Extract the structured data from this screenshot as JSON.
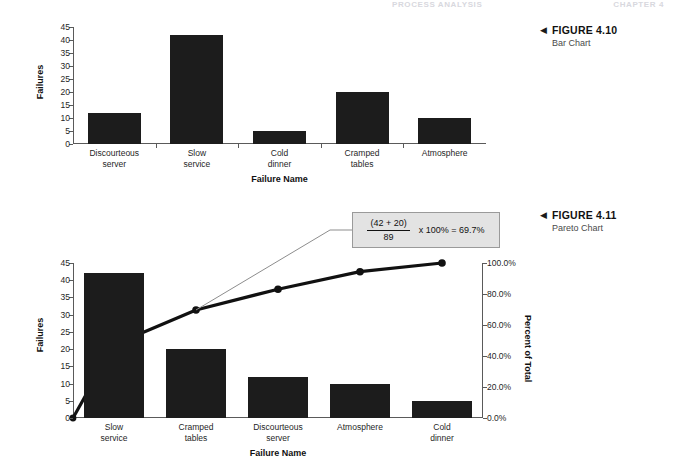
{
  "running_head": {
    "left_text": "PROCESS ANALYSIS",
    "right_text": "CHAPTER 4"
  },
  "figures": [
    {
      "id": "fig-4-10",
      "arrow_glyph": "◀",
      "title": "FIGURE 4.10",
      "subtitle": "Bar Chart"
    },
    {
      "id": "fig-4-11",
      "arrow_glyph": "◀",
      "title": "FIGURE 4.11",
      "subtitle": "Pareto Chart"
    }
  ],
  "chart_data": [
    {
      "type": "bar",
      "id": "bar-chart",
      "title": "",
      "xlabel": "Failure Name",
      "ylabel": "Failures",
      "ylim": [
        0,
        45
      ],
      "ytick_values": [
        0,
        5,
        10,
        15,
        20,
        25,
        30,
        35,
        40,
        45
      ],
      "ytick_labels": [
        "0",
        "5",
        "10",
        "15",
        "20",
        "25",
        "30",
        "35",
        "40",
        "45"
      ],
      "grid": false,
      "legend": "none",
      "bar_color": "#1c1c1c",
      "categories": [
        "Discourteous\nserver",
        "Slow\nservice",
        "Cold\ndinner",
        "Cramped\ntables",
        "Atmosphere"
      ],
      "values": [
        12,
        42,
        5,
        20,
        10
      ]
    },
    {
      "type": "bar",
      "id": "pareto-chart",
      "title": "",
      "xlabel": "Failure Name",
      "ylabel": "Failures",
      "y2label": "Percent of Total",
      "ylim": [
        0,
        45
      ],
      "ytick_values": [
        0,
        5,
        10,
        15,
        20,
        25,
        30,
        35,
        40,
        45
      ],
      "ytick_labels": [
        "0",
        "5",
        "10",
        "15",
        "20",
        "25",
        "30",
        "35",
        "40",
        "45"
      ],
      "y2lim": [
        0,
        100
      ],
      "y2tick_values": [
        0,
        20,
        40,
        60,
        80,
        100
      ],
      "y2tick_labels": [
        "0.0%",
        "20.0%",
        "40.0%",
        "60.0%",
        "80.0%",
        "100.0%"
      ],
      "grid": false,
      "legend": "none",
      "bar_color": "#1c1c1c",
      "line_color": "#111111",
      "categories": [
        "Slow\nservice",
        "Cramped\ntables",
        "Discourteous\nserver",
        "Atmosphere",
        "Cold\ndinner"
      ],
      "values": [
        42,
        20,
        12,
        10,
        5
      ],
      "series": [
        {
          "name": "Cumulative Percent of Total",
          "axis": "y2",
          "values": [
            47.2,
            69.7,
            83.1,
            94.4,
            100.0
          ],
          "origin_value": 0.0
        }
      ],
      "total": 89,
      "annotations": [
        {
          "id": "callout-69-7",
          "numerator": "(42 + 20)",
          "denominator": "89",
          "expression": "x 100% = 69.7%",
          "points_to_category": "Cramped\ntables",
          "points_to_value": 69.7
        }
      ]
    }
  ]
}
